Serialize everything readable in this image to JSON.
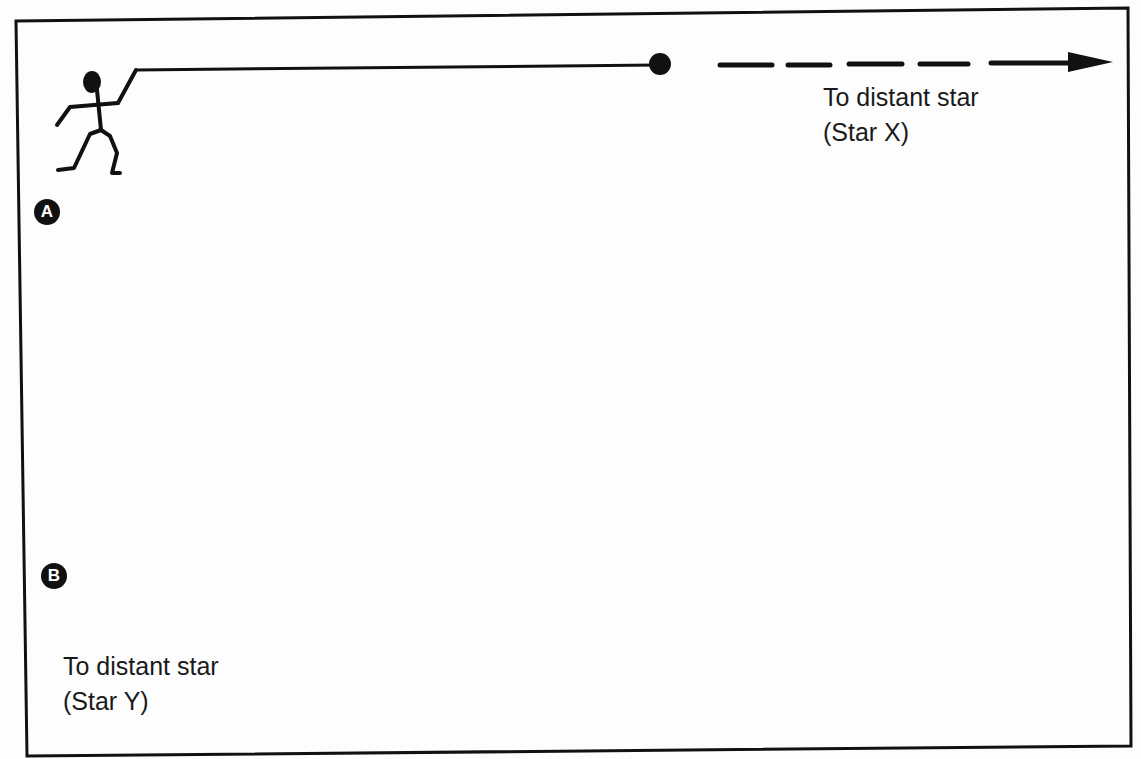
{
  "figure": {
    "type": "relativity thought-experiment diagram",
    "colors": {
      "ink": "#111111",
      "background": "#fdfdfd"
    },
    "panels": [
      {
        "label": "A",
        "figure_position": "top-left",
        "rope_direction": "right",
        "arrow_direction": "right",
        "destination_label_line1": "To distant star",
        "destination_label_line2": "(Star X)"
      },
      {
        "label": "B",
        "figure_position": "bottom-center",
        "rope_direction": "right",
        "arrow_direction": "left",
        "destination_label_line1": "To distant star",
        "destination_label_line2": "(Star Y)"
      }
    ],
    "connector": {
      "description": "curved dashed path linking rope end of A down to figure B, with arrows pointing toward each other's midpoint",
      "arrowheads": [
        "down (near A's ball)",
        "up (near B's figure)"
      ]
    }
  }
}
